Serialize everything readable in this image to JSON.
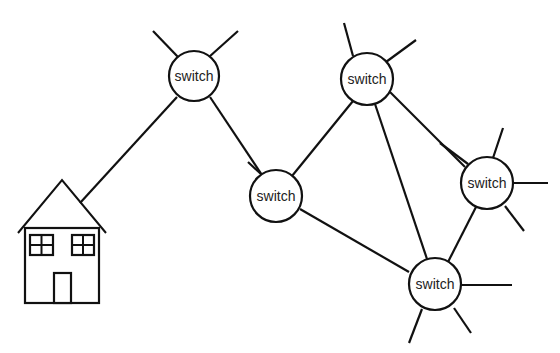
{
  "diagram": {
    "type": "network-topology",
    "nodes": [
      {
        "id": "s1",
        "label": "switch",
        "x": 194,
        "y": 76
      },
      {
        "id": "s2",
        "label": "switch",
        "x": 367,
        "y": 79
      },
      {
        "id": "s3",
        "label": "switch",
        "x": 276,
        "y": 196
      },
      {
        "id": "s4",
        "label": "switch",
        "x": 487,
        "y": 183
      },
      {
        "id": "s5",
        "label": "switch",
        "x": 434,
        "y": 284
      }
    ],
    "house": {
      "label": "house",
      "x": 60,
      "y": 250
    },
    "edges": [
      [
        "house",
        "s1"
      ],
      [
        "s1",
        "s3"
      ],
      [
        "s3",
        "s2"
      ],
      [
        "s3",
        "s5"
      ],
      [
        "s2",
        "s5"
      ],
      [
        "s2",
        "s4"
      ],
      [
        "s4",
        "s5"
      ]
    ],
    "colors": {
      "stroke": "#111111",
      "background": "#ffffff",
      "text": "#222222"
    }
  }
}
